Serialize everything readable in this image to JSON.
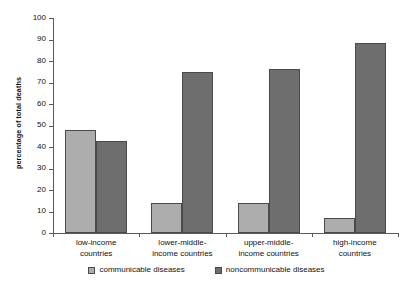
{
  "chart_data": {
    "type": "bar",
    "title": "",
    "subtitle": "",
    "xlabel": "",
    "ylabel": "percentage of total deaths",
    "ylim": [
      0,
      100
    ],
    "ytick_labels": [
      "0",
      "10",
      "20",
      "30",
      "40",
      "50",
      "60",
      "70",
      "80",
      "90",
      "100"
    ],
    "ytick_values": [
      0,
      10,
      20,
      30,
      40,
      50,
      60,
      70,
      80,
      90,
      100
    ],
    "grid": false,
    "legend_position": "bottom",
    "categories": [
      "low-income\ncountries",
      "lower-middle-\nincome countries",
      "upper-middle-\nincome countries",
      "high-income\ncountries"
    ],
    "series": [
      {
        "name": "communicable diseases",
        "color": "#adadad",
        "values": [
          48,
          14,
          14,
          7
        ]
      },
      {
        "name": "noncommunicable diseases",
        "color": "#6e6e6e",
        "values": [
          43,
          75,
          76.5,
          88.5
        ]
      }
    ]
  },
  "legend": {
    "items": [
      {
        "label": "communicable diseases",
        "color": "#adadad"
      },
      {
        "label": "noncommunicable diseases",
        "color": "#6e6e6e"
      }
    ]
  },
  "colors": {
    "light_bar": "#adadad",
    "dark_bar": "#6e6e6e",
    "axis": "#5a5a5a",
    "bar_border": "#4a4a4a",
    "background": "#ffffff",
    "text": "#111111"
  }
}
